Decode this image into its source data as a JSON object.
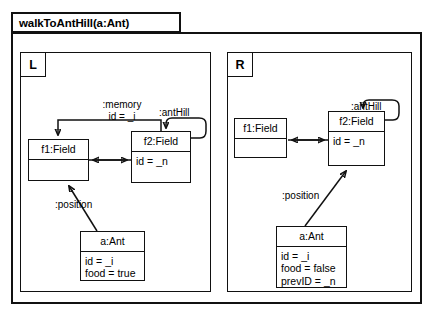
{
  "diagram": {
    "type": "uml-object-transformation-rule",
    "title": "walkToAntHill(a:Ant)",
    "panels": [
      {
        "id": "L",
        "tag": "L",
        "objects": [
          {
            "id": "l-f1",
            "name": "f1:Field",
            "attributes": []
          },
          {
            "id": "l-f2",
            "name": "f2:Field",
            "attributes": [
              "id = _n"
            ]
          },
          {
            "id": "l-ant",
            "name": "a:Ant",
            "attributes": [
              "id = _i",
              "food = true"
            ]
          }
        ],
        "edges": [
          {
            "id": "l-memory",
            "label": ":memory",
            "label2": "id = _i",
            "from": "l-f2",
            "to": "l-f1",
            "style": "elbow-top",
            "arrow": "single"
          },
          {
            "id": "l-anthill",
            "label": ":antHill",
            "from": "l-f2",
            "to": "l-f2",
            "style": "self-loop",
            "arrow": "single"
          },
          {
            "id": "l-f1f2",
            "label": "",
            "from": "l-f1",
            "to": "l-f2",
            "style": "straight",
            "arrow": "double"
          },
          {
            "id": "l-position",
            "label": ":position",
            "from": "l-ant",
            "to": "l-f1",
            "style": "diagonal",
            "arrow": "single"
          }
        ]
      },
      {
        "id": "R",
        "tag": "R",
        "objects": [
          {
            "id": "r-f1",
            "name": "f1:Field",
            "attributes": []
          },
          {
            "id": "r-f2",
            "name": "f2:Field",
            "attributes": [
              "id = _n"
            ]
          },
          {
            "id": "r-ant",
            "name": "a:Ant",
            "attributes": [
              "id = _i",
              "food = false",
              "prevID = _n"
            ]
          }
        ],
        "edges": [
          {
            "id": "r-anthill",
            "label": ":antHill",
            "from": "r-f2",
            "to": "r-f2",
            "style": "self-loop",
            "arrow": "single"
          },
          {
            "id": "r-f1f2",
            "label": "",
            "from": "r-f1",
            "to": "r-f2",
            "style": "straight",
            "arrow": "double"
          },
          {
            "id": "r-position",
            "label": ":position",
            "from": "r-ant",
            "to": "r-f2",
            "style": "diagonal",
            "arrow": "single"
          }
        ]
      }
    ],
    "colors": {
      "stroke": "#111111",
      "background": "#ffffff",
      "text": "#000000"
    }
  }
}
